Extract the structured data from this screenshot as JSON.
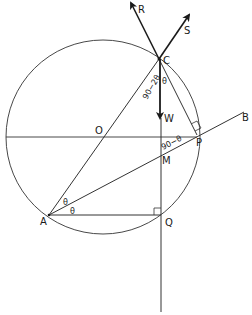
{
  "diagram": {
    "type": "geometry-forces",
    "colors": {
      "line": "#333333",
      "text": "#1a1a1a",
      "background": "#ffffff"
    },
    "circle": {
      "center_label": "O",
      "cx": 103,
      "cy": 137,
      "r": 97
    },
    "points": {
      "C": {
        "label": "C",
        "x": 159,
        "y": 59
      },
      "O": {
        "label": "O",
        "x": 103,
        "y": 137
      },
      "P": {
        "label": "P",
        "x": 197,
        "y": 135
      },
      "M": {
        "label": "M",
        "x": 161,
        "y": 152
      },
      "A": {
        "label": "A",
        "x": 49,
        "y": 215
      },
      "Q": {
        "label": "Q",
        "x": 161,
        "y": 216
      },
      "B": {
        "label": "B"
      }
    },
    "forces": {
      "R": {
        "label": "R"
      },
      "S": {
        "label": "S"
      },
      "W": {
        "label": "W"
      }
    },
    "angles": {
      "at_C_left": "90−2θ",
      "at_C_right": "θ",
      "at_M": "90−θ",
      "at_A_upper": "θ",
      "at_A_lower": "θ"
    }
  }
}
